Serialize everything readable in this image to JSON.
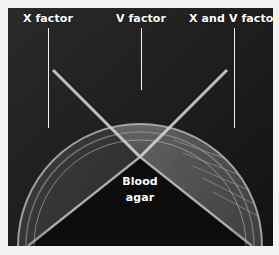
{
  "figure": {
    "type": "photograph",
    "colors": {
      "page_background": "#f3f3f3",
      "photo_background": "#1c1c1c",
      "label_text": "#ffffff"
    },
    "labels": {
      "x_factor": "X factor",
      "v_factor": "V factor",
      "x_and_v_factor": "X and V factor",
      "blood_agar_line1": "Blood",
      "blood_agar_line2": "agar"
    }
  }
}
